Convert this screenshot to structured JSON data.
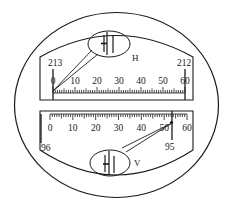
{
  "figure": {
    "colors": {
      "ink": "#1a1a1a",
      "background": "#ffffff"
    }
  },
  "horizontal_window": {
    "letter": "H",
    "degree_left": "213",
    "degree_right": "212",
    "scale_labels": [
      "0",
      "10",
      "20",
      "30",
      "40",
      "50",
      "60"
    ],
    "index_reading_degree": "213",
    "index_position_minutes": 0,
    "magnifier_icon": "split-index-lines-icon"
  },
  "vertical_window": {
    "letter": "V",
    "degree_left": "96",
    "degree_right": "95",
    "scale_labels": [
      "0",
      "10",
      "20",
      "30",
      "40",
      "50",
      "60"
    ],
    "index_reading_degree": "95",
    "index_position_minutes": 54,
    "magnifier_icon": "split-index-lines-icon"
  }
}
